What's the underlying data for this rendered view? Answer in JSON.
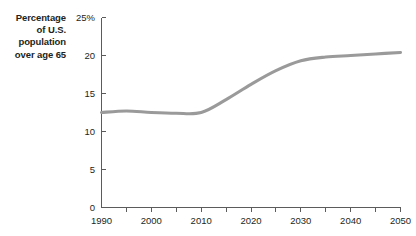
{
  "axis_title": {
    "lines": [
      "Percentage",
      "of U.S.",
      "population",
      "over age 65"
    ]
  },
  "colors": {
    "line": "#9a9a9a",
    "axis": "#5b5b5b",
    "text": "#231f20",
    "background": "#ffffff"
  },
  "chart_data": {
    "type": "line",
    "title": "",
    "subtitle": "",
    "xlabel": "",
    "ylabel": "Percentage of U.S. population over age 65",
    "xlim": [
      1990,
      2050
    ],
    "ylim": [
      0,
      25
    ],
    "grid": false,
    "legend": "none",
    "x_ticks": [
      1990,
      2000,
      2010,
      2020,
      2030,
      2040,
      2050
    ],
    "x_tick_labels": [
      "1990",
      "2000",
      "2010",
      "2020",
      "2030",
      "2040",
      "2050"
    ],
    "x_minor_ticks": [
      1995,
      2005,
      2015,
      2025,
      2035,
      2045
    ],
    "y_ticks": [
      0,
      5,
      10,
      15,
      20,
      25
    ],
    "y_tick_labels": [
      "0",
      "5",
      "10",
      "15",
      "20",
      "25%"
    ],
    "series": [
      {
        "name": "Percentage of U.S. population over age 65",
        "color": "#9a9a9a",
        "x": [
          1990,
          1995,
          2000,
          2005,
          2010,
          2015,
          2020,
          2025,
          2030,
          2035,
          2040,
          2045,
          2050
        ],
        "values": [
          12.5,
          12.7,
          12.5,
          12.4,
          12.5,
          14.2,
          16.2,
          18.0,
          19.3,
          19.8,
          20.0,
          20.2,
          20.4
        ]
      }
    ]
  }
}
